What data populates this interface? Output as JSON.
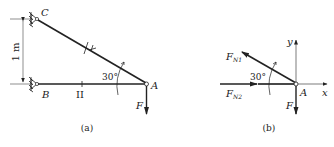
{
  "panel_a": {
    "caption": "(a)",
    "labels": {
      "C": "C",
      "B": "B",
      "A": "A",
      "F": "F",
      "angle": "30°",
      "dimension": "1 m",
      "member_I": "I",
      "member_II": "II"
    }
  },
  "panel_b": {
    "caption": "(b)",
    "labels": {
      "A": "A",
      "F": "F",
      "FN1_main": "F",
      "FN1_sub": "N1",
      "FN2_main": "F",
      "FN2_sub": "N2",
      "angle": "30°",
      "x_axis": "x",
      "y_axis": "y"
    }
  },
  "colors": {
    "line": "#222222",
    "background": "#ffffff"
  }
}
